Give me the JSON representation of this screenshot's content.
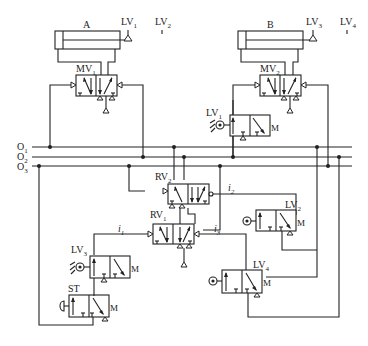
{
  "diagram": {
    "type": "pneumatic-circuit",
    "cylinders": [
      {
        "id": "A",
        "label": "A"
      },
      {
        "id": "B",
        "label": "B"
      }
    ],
    "limit_valves": [
      {
        "id": "LV1",
        "main": "LV",
        "sub": "1"
      },
      {
        "id": "LV2",
        "main": "LV",
        "sub": "2"
      },
      {
        "id": "LV3",
        "main": "LV",
        "sub": "3"
      },
      {
        "id": "LV4",
        "main": "LV",
        "sub": "4"
      }
    ],
    "main_valves": [
      {
        "id": "MV1",
        "main": "MV",
        "sub": "1"
      },
      {
        "id": "MV2",
        "main": "MV",
        "sub": "2"
      }
    ],
    "relay_valves": [
      {
        "id": "RV1",
        "main": "RV",
        "sub": "1"
      },
      {
        "id": "RV2",
        "main": "RV",
        "sub": "2"
      }
    ],
    "start_valve": {
      "id": "ST",
      "label": "ST"
    },
    "lines": [
      {
        "id": "O1",
        "main": "O",
        "sub": "1"
      },
      {
        "id": "O2",
        "main": "O",
        "sub": "2"
      },
      {
        "id": "O3",
        "main": "O",
        "sub": "3"
      }
    ],
    "signals": [
      {
        "id": "i1",
        "main": "i",
        "sub": "1"
      },
      {
        "id": "i2",
        "main": "i",
        "sub": "2"
      },
      {
        "id": "i3",
        "main": "i",
        "sub": "3"
      }
    ]
  }
}
